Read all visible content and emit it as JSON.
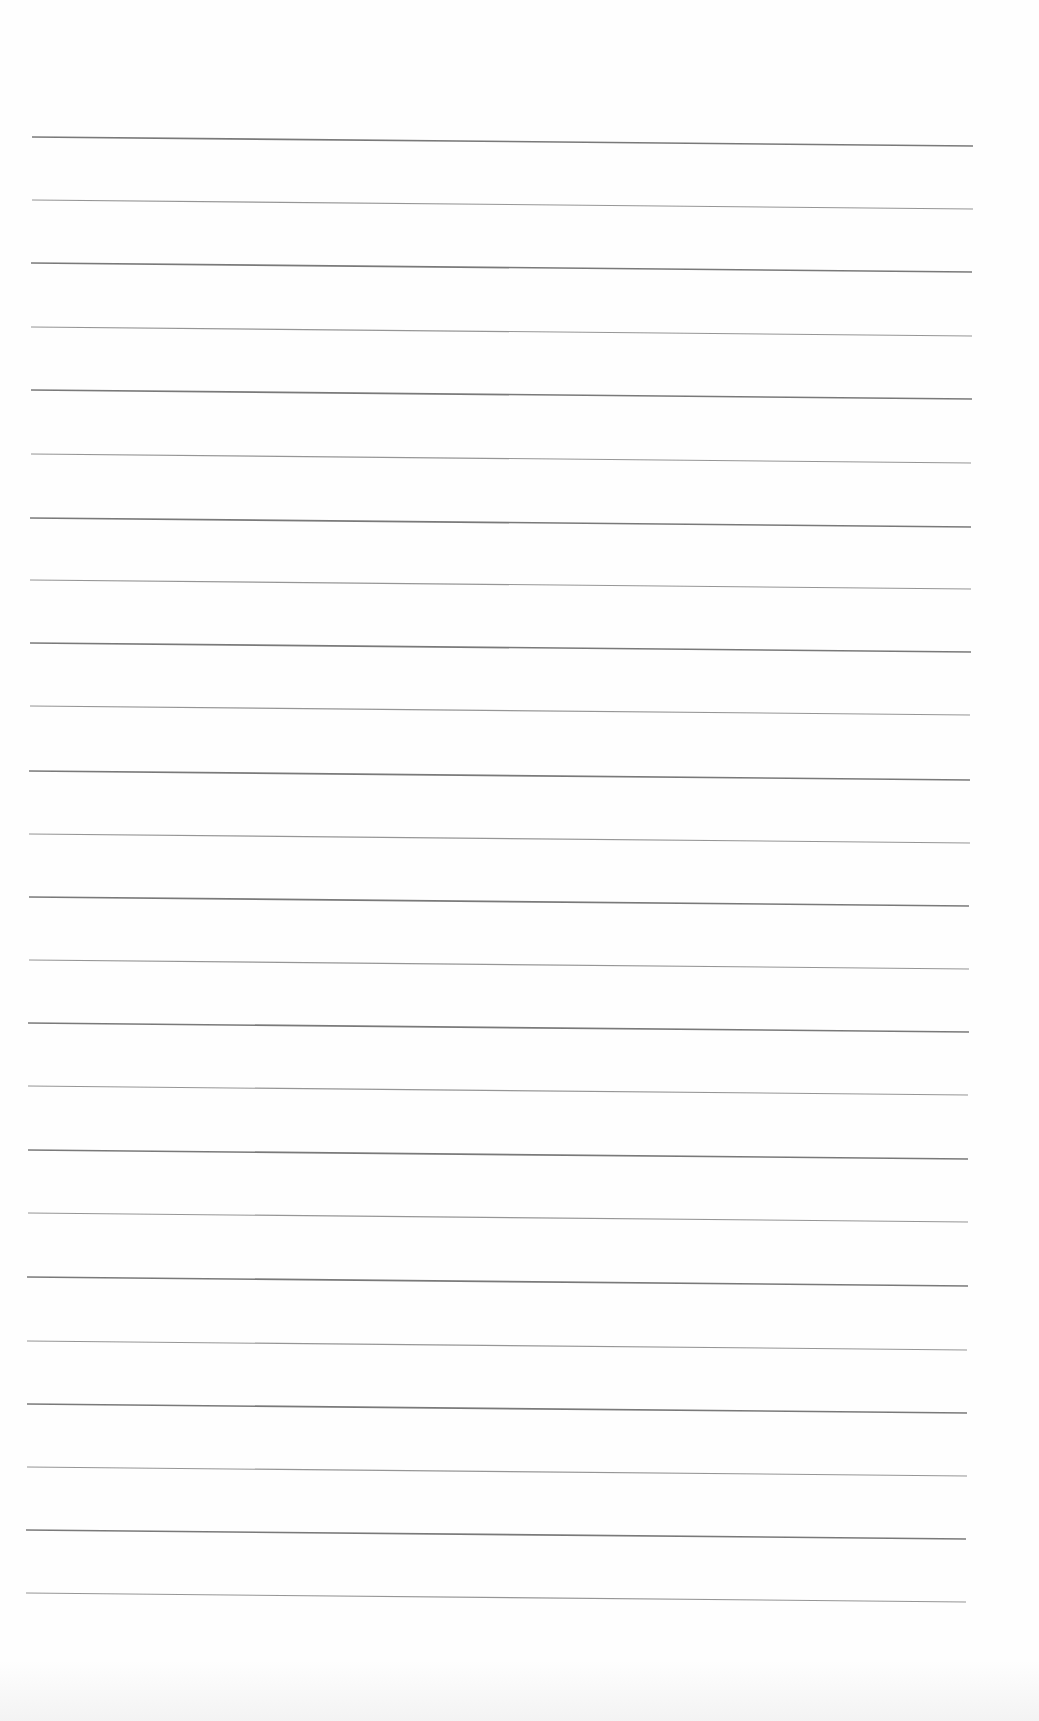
{
  "document": {
    "type": "ruled-paper",
    "text": "",
    "paper_color": "#fefefe",
    "rule_color": "#6a6a6a",
    "rules": {
      "count": 24,
      "x_start": 32,
      "x_end_top": 973,
      "x_end_bottom": 966,
      "slant_px": 9,
      "y_positions": [
        137,
        200,
        263,
        327,
        390,
        454,
        518,
        580,
        643,
        706,
        771,
        834,
        897,
        960,
        1023,
        1086,
        1150,
        1213,
        1277,
        1341,
        1404,
        1467,
        1530,
        1593
      ]
    }
  }
}
